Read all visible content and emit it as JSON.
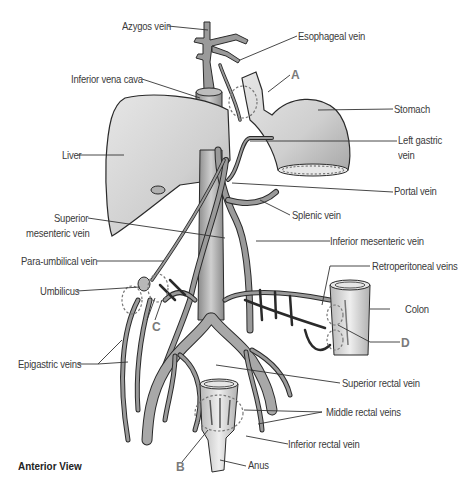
{
  "diagram": {
    "caption": "Anterior View",
    "labels": {
      "azygos_vein": "Azygos vein",
      "esophageal_vein": "Esophageal vein",
      "inferior_vena_cava": "Inferior vena cava",
      "stomach": "Stomach",
      "liver": "Liver",
      "left_gastric_vein": "Left gastric vein",
      "left_gastric_vein_line1": "Left gastric",
      "left_gastric_vein_line2": "vein",
      "portal_vein": "Portal vein",
      "splenic_vein": "Splenic vein",
      "superior_mesenteric_vein_line1": "Superior",
      "superior_mesenteric_vein_line2": "mesenteric vein",
      "inferior_mesenteric_vein": "Inferior mesenteric vein",
      "para_umbilical_vein": "Para-umbilical vein",
      "retroperitoneal_veins": "Retroperitoneal veins",
      "umbilicus": "Umbilicus",
      "colon": "Colon",
      "epigastric_veins": "Epigastric veins",
      "superior_rectal_vein": "Superior rectal vein",
      "middle_rectal_veins": "Middle rectal veins",
      "inferior_rectal_vein": "Inferior rectal vein",
      "anus": "Anus"
    },
    "anastomosis_sites": {
      "A": "A",
      "B": "B",
      "C": "C",
      "D": "D"
    },
    "colors": {
      "organ_fill": "#d4d4d4",
      "vein_fill": "#9a9a9a",
      "outline": "#2a2a2a",
      "leader_line": "#333333",
      "site_letter": "#7a7a7a"
    }
  }
}
